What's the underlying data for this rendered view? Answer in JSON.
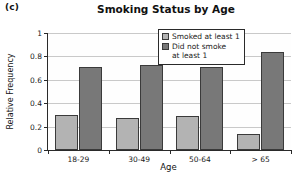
{
  "panel_label": "(c)",
  "chart_data": {
    "type": "bar",
    "title": "Smoking Status by Age",
    "xlabel": "Age",
    "ylabel": "Relative Frequency",
    "categories": [
      "18-29",
      "30-49",
      "50-64",
      "> 65"
    ],
    "series": [
      {
        "name": "Smoked at least 1",
        "color": "#b3b3b3",
        "values": [
          0.3,
          0.27,
          0.29,
          0.14
        ]
      },
      {
        "name": "Did not smoke\nat least 1",
        "color": "#787878",
        "values": [
          0.71,
          0.73,
          0.71,
          0.84
        ]
      }
    ],
    "ylim": [
      0,
      1
    ],
    "yticks": [
      "0",
      "0.2",
      "0.4",
      "0.6",
      "0.8",
      "1"
    ],
    "ytick_values": [
      0,
      0.2,
      0.4,
      0.6,
      0.8,
      1
    ],
    "grid": true,
    "legend_position": "top-right"
  }
}
